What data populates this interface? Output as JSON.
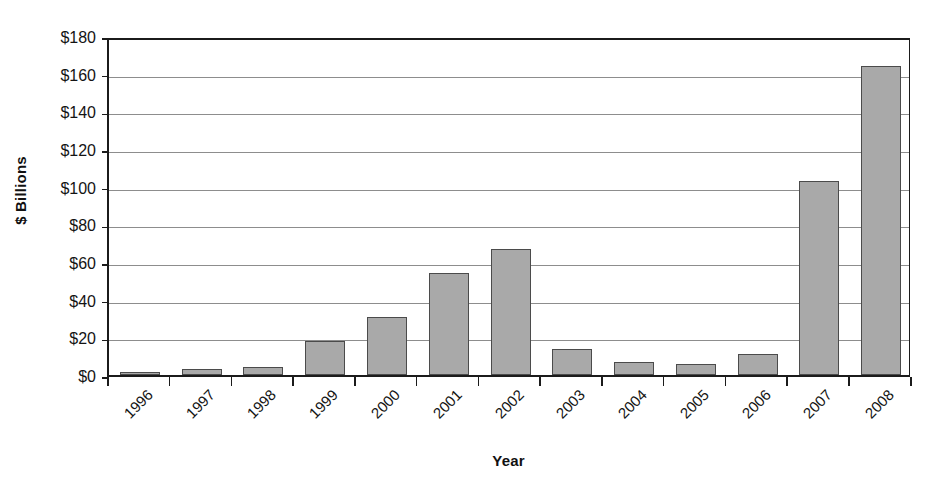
{
  "chart_data": {
    "type": "bar",
    "title": "",
    "subtitle": "",
    "xlabel": "Year",
    "ylabel": "$ Billions",
    "categories": [
      "1996",
      "1997",
      "1998",
      "1999",
      "2000",
      "2001",
      "2002",
      "2003",
      "2004",
      "2005",
      "2006",
      "2007",
      "2008"
    ],
    "values": [
      1,
      3,
      4,
      18,
      31,
      54,
      67,
      14,
      7,
      6,
      11,
      103,
      164
    ],
    "series": [
      {
        "name": "",
        "values": [
          1,
          3,
          4,
          18,
          31,
          54,
          67,
          14,
          7,
          6,
          11,
          103,
          164
        ]
      }
    ],
    "ylim": [
      0,
      180
    ],
    "ytick_values": [
      0,
      20,
      40,
      60,
      80,
      100,
      120,
      140,
      160,
      180
    ],
    "ytick_labels": [
      "$0",
      "$20",
      "$40",
      "$60",
      "$80",
      "$100",
      "$120",
      "$140",
      "$160",
      "$180"
    ],
    "ytick_step": 20,
    "grid": true,
    "grid_axis": "y",
    "legend": false,
    "legend_position": "none",
    "xtick_label_rotation": -45,
    "bar_fill_color": "#a9a9a9",
    "bar_border_color": "#4b4b4b",
    "gridline_color": "#8d8d8d",
    "axis_color": "#1b1b1b",
    "background_color": "#ffffff",
    "annotations": []
  }
}
